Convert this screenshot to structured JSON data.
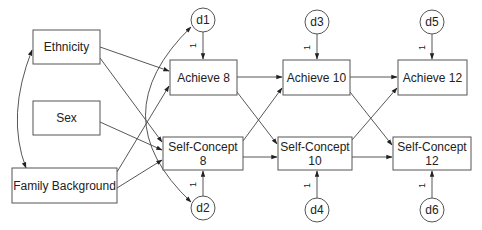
{
  "diagram": {
    "type": "path-model",
    "header_fragment": "",
    "colors": {
      "stroke": "#555555",
      "edge": "#444444",
      "text": "#222222",
      "background": "#ffffff"
    },
    "exogenous": [
      {
        "id": "ethnicity",
        "label": "Ethnicity"
      },
      {
        "id": "sex",
        "label": "Sex"
      },
      {
        "id": "family_background",
        "label": "Family Background"
      }
    ],
    "endogenous": [
      {
        "id": "achieve8",
        "label": "Achieve 8"
      },
      {
        "id": "achieve10",
        "label": "Achieve 10"
      },
      {
        "id": "achieve12",
        "label": "Achieve 12"
      },
      {
        "id": "selfconcept8",
        "line1": "Self-Concept",
        "line2": "8"
      },
      {
        "id": "selfconcept10",
        "line1": "Self-Concept",
        "line2": "10"
      },
      {
        "id": "selfconcept12",
        "line1": "Self-Concept",
        "line2": "12"
      }
    ],
    "disturbances": [
      {
        "id": "d1",
        "label": "d1",
        "target": "achieve8",
        "loading": "1"
      },
      {
        "id": "d2",
        "label": "d2",
        "target": "selfconcept8",
        "loading": "1"
      },
      {
        "id": "d3",
        "label": "d3",
        "target": "achieve10",
        "loading": "1"
      },
      {
        "id": "d4",
        "label": "d4",
        "target": "selfconcept10",
        "loading": "1"
      },
      {
        "id": "d5",
        "label": "d5",
        "target": "achieve12",
        "loading": "1"
      },
      {
        "id": "d6",
        "label": "d6",
        "target": "selfconcept12",
        "loading": "1"
      }
    ],
    "paths": [
      [
        "ethnicity",
        "achieve8"
      ],
      [
        "ethnicity",
        "selfconcept8"
      ],
      [
        "sex",
        "selfconcept8"
      ],
      [
        "family_background",
        "achieve8"
      ],
      [
        "family_background",
        "selfconcept8"
      ],
      [
        "achieve8",
        "achieve10"
      ],
      [
        "achieve8",
        "selfconcept10"
      ],
      [
        "selfconcept8",
        "achieve10"
      ],
      [
        "selfconcept8",
        "selfconcept10"
      ],
      [
        "achieve10",
        "achieve12"
      ],
      [
        "achieve10",
        "selfconcept12"
      ],
      [
        "selfconcept10",
        "achieve12"
      ],
      [
        "selfconcept10",
        "selfconcept12"
      ]
    ],
    "covariances": [
      [
        "ethnicity",
        "family_background"
      ],
      [
        "d1",
        "d2"
      ]
    ]
  }
}
